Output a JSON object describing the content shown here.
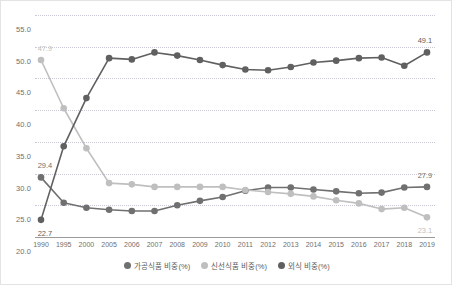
{
  "chart_data": {
    "type": "line",
    "title": "",
    "xlabel": "",
    "ylabel": "",
    "ylim": [
      20.0,
      55.0
    ],
    "ystep": 5.0,
    "grid": true,
    "legend_position": "bottom-center",
    "ytick_labels": [
      "55.0",
      "50.0",
      "45.0",
      "40.0",
      "35.0",
      "30.0",
      "25.0",
      "20.0"
    ],
    "categories": [
      "1990",
      "1995",
      "2000",
      "2005",
      "2006",
      "2007",
      "2008",
      "2009",
      "2010",
      "2011",
      "2012",
      "2013",
      "2014",
      "2015",
      "2016",
      "2017",
      "2018",
      "2019"
    ],
    "series": [
      {
        "name": "가공식품 비중(%)",
        "color": "#707070",
        "values": [
          29.4,
          25.4,
          24.6,
          24.3,
          24.1,
          24.1,
          25.0,
          25.7,
          26.3,
          27.3,
          27.8,
          27.8,
          27.5,
          27.2,
          26.9,
          27.0,
          27.8,
          27.9
        ],
        "point_labels": {
          "1990": "29.4",
          "2019": "27.9"
        }
      },
      {
        "name": "신선식품 비중(%)",
        "color": "#bfbfbf",
        "values": [
          47.9,
          40.3,
          34.0,
          28.5,
          28.3,
          27.9,
          27.9,
          27.9,
          27.9,
          27.4,
          27.1,
          26.8,
          26.4,
          25.8,
          25.3,
          24.4,
          24.6,
          23.1
        ],
        "point_labels": {
          "1990": "47.9",
          "2019": "23.1"
        }
      },
      {
        "name": "외식 비중(%)",
        "color": "#606060",
        "values": [
          22.7,
          34.3,
          41.9,
          48.2,
          48.0,
          49.1,
          48.6,
          47.9,
          47.1,
          46.4,
          46.3,
          46.8,
          47.5,
          47.8,
          48.2,
          48.3,
          47.0,
          49.1
        ],
        "point_labels": {
          "1990": "22.7",
          "2019": "49.1"
        }
      }
    ]
  },
  "legend": {
    "items": [
      {
        "label": "가공식품 비중(%)",
        "color": "#707070"
      },
      {
        "label": "신선식품 비중(%)",
        "color": "#bfbfbf"
      },
      {
        "label": "외식 비중(%)",
        "color": "#606060"
      }
    ]
  }
}
